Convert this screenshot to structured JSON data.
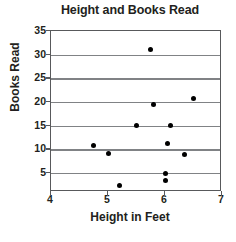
{
  "chart_data": {
    "type": "scatter",
    "title": "Height and Books Read",
    "xlabel": "Height in Feet",
    "ylabel": "Books Read",
    "xlim": [
      4,
      7
    ],
    "ylim": [
      0,
      35
    ],
    "xticks": [
      4,
      5,
      6,
      7
    ],
    "yticks": [
      5,
      10,
      15,
      20,
      25,
      30,
      35
    ],
    "xtick_labels": [
      "4",
      "5",
      "6",
      "7"
    ],
    "ytick_labels": [
      "5",
      "10",
      "15",
      "20",
      "25",
      "30",
      "35"
    ],
    "grid": "horizontal",
    "legend": "none",
    "marker": "filled-circle",
    "marker_color": "#000000",
    "grid_color": "#808285",
    "axis_color": "#58595b",
    "text_color": "#231f20",
    "points": [
      {
        "x": 4.75,
        "y": 10.8
      },
      {
        "x": 5.0,
        "y": 9.1
      },
      {
        "x": 5.2,
        "y": 2.4
      },
      {
        "x": 5.5,
        "y": 15.0
      },
      {
        "x": 5.75,
        "y": 31.0
      },
      {
        "x": 5.8,
        "y": 19.5
      },
      {
        "x": 6.0,
        "y": 5.0
      },
      {
        "x": 6.0,
        "y": 3.5
      },
      {
        "x": 6.05,
        "y": 11.2
      },
      {
        "x": 6.1,
        "y": 15.0
      },
      {
        "x": 6.35,
        "y": 9.0
      },
      {
        "x": 6.5,
        "y": 20.8
      }
    ]
  }
}
